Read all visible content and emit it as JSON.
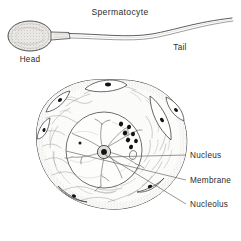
{
  "figure": {
    "title": "Spermatocyte",
    "background_color": "#ffffff",
    "ink_color": "#2b2b2b",
    "line_color": "#3a3a3a"
  },
  "sperm_diagram": {
    "name": "spermatocyte-overview",
    "title_label": "Spermatocyte",
    "head_label": "Head",
    "tail_label": "Tail",
    "head_fill": "#e8e6e3",
    "head_shape": "stippled-oval",
    "tail_shape": "long-wavy-flagellum"
  },
  "cell_diagram": {
    "name": "magnified-spermatocyte-cell",
    "cell_shape": "irregular-rounded-polygon",
    "cytoplasm_fill": "#fbfbfa",
    "nucleus_fill": "#fdfdfc",
    "nucleolus_fill": "#1a1a1a",
    "granule_fill": "#121212",
    "satellite_cell_count": 7,
    "granule_count": 7,
    "labels": [
      {
        "id": "nucleus",
        "text": "Nucleus"
      },
      {
        "id": "membrane",
        "text": "Membrane"
      },
      {
        "id": "nucleolus",
        "text": "Nucleolus"
      }
    ]
  }
}
